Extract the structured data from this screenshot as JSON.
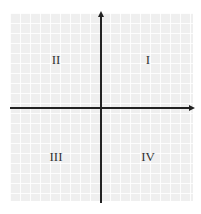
{
  "diagram": {
    "type": "cartesian-plane",
    "quadrants": [
      {
        "id": "q1",
        "label": "I"
      },
      {
        "id": "q2",
        "label": "II"
      },
      {
        "id": "q3",
        "label": "III"
      },
      {
        "id": "q4",
        "label": "IV"
      }
    ],
    "colors": {
      "axis": "#222222",
      "grid_background": "#efefef",
      "grid_lines": "#ffffff",
      "label": "#333333"
    }
  }
}
